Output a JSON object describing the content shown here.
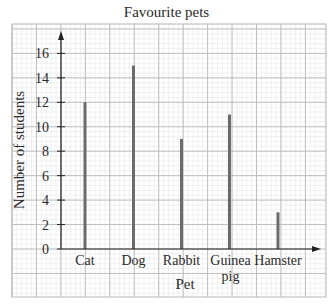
{
  "chart_data": {
    "type": "bar",
    "title": "Favourite pets",
    "xlabel": "Pet",
    "ylabel": "Number of students",
    "categories": [
      "Cat",
      "Dog",
      "Rabbit",
      "Guinea pig",
      "Hamster"
    ],
    "category_label_lines": [
      [
        "Cat"
      ],
      [
        "Dog"
      ],
      [
        "Rabbit"
      ],
      [
        "Guinea",
        "pig"
      ],
      [
        "Hamster"
      ]
    ],
    "values": [
      12,
      15,
      9,
      11,
      3
    ],
    "yticks": [
      0,
      2,
      4,
      6,
      8,
      10,
      12,
      14,
      16
    ],
    "ylim": [
      0,
      17.5
    ],
    "grid": true,
    "style": "vertical line graph (thin bars) on graph paper"
  },
  "colors": {
    "bar": "#6b6b6b",
    "axis": "#222222",
    "major_grid": "#b9b9b9",
    "minor_grid": "#e3e3e3"
  }
}
